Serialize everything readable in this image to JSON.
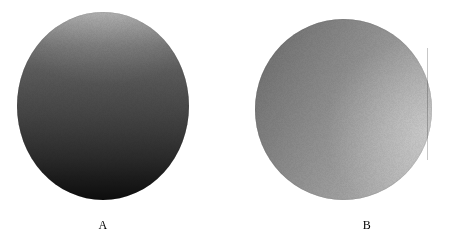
{
  "figure": {
    "background_color": "#ffffff",
    "width": 450,
    "height": 239,
    "caption_font_style": "serif"
  },
  "objects": [
    {
      "id": "A",
      "label": "A",
      "shape": "sphere",
      "shading": "vertical gradient, light at top, dark at bottom",
      "light_direction": "from above",
      "light_color": "#a0a0a0",
      "shadow_color": "#0d0d0d",
      "center_x": 103,
      "center_y": 106,
      "radius_x": 86,
      "radius_y": 94
    },
    {
      "id": "B",
      "label": "B",
      "shape": "sphere",
      "shading": "diagonal gradient, dark at upper-left, light at right and lower-right",
      "light_direction": "from the right",
      "light_color": "#b8b8b8",
      "shadow_color": "#6a6a6a",
      "center_x": 343,
      "center_y": 109,
      "radius_x": 88,
      "radius_y": 90
    }
  ],
  "labels": {
    "a": "A",
    "b": "B"
  }
}
